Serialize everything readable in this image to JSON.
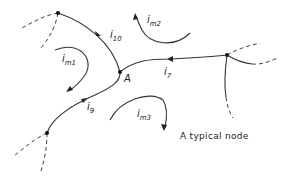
{
  "figure": {
    "caption": "A typical node",
    "node_label": "A",
    "branch_currents": [
      {
        "id": "i10",
        "base": "i",
        "sub": "10"
      },
      {
        "id": "i7",
        "base": "i",
        "sub": "7"
      },
      {
        "id": "i9",
        "base": "i",
        "sub": "9"
      }
    ],
    "mesh_currents": [
      {
        "id": "im1",
        "base": "i",
        "sub": "m1"
      },
      {
        "id": "im2",
        "base": "i",
        "sub": "m2"
      },
      {
        "id": "im3",
        "base": "i",
        "sub": "m3"
      }
    ],
    "colors": {
      "line": "#333333",
      "background": "#ffffff"
    }
  }
}
